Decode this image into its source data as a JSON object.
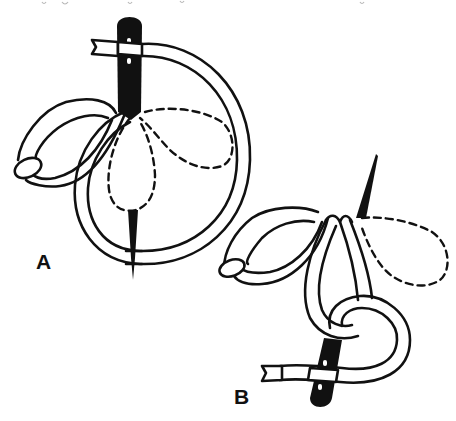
{
  "figure": {
    "colors": {
      "ink": "#111111",
      "background": "#ffffff"
    },
    "panels": [
      {
        "label": "A",
        "description": "Needle inserted; thread looped in large circle around needle; first petal with tack stitch; dashed outlines of next petals"
      },
      {
        "label": "B",
        "description": "Two petals completed; needle brought up inside loop; dashed outline of next petal"
      }
    ],
    "icons": [
      "needle-icon",
      "thread-loop-icon",
      "petal-icon",
      "tack-stitch-icon",
      "dashed-petal-outline-icon"
    ]
  }
}
